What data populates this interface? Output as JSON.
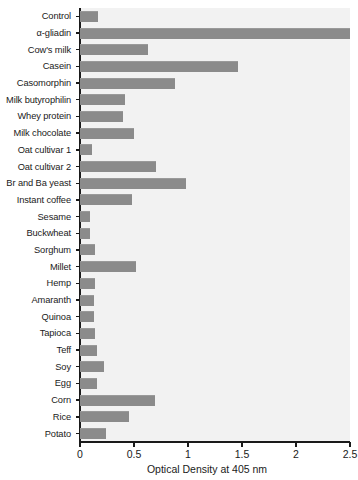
{
  "chart_data": {
    "type": "bar",
    "orientation": "horizontal",
    "title": "",
    "xlabel": "Optical Density at 405 nm",
    "ylabel": "",
    "xlim": [
      0,
      2.5
    ],
    "xticks": [
      0,
      0.5,
      1,
      1.5,
      2,
      2.5
    ],
    "xtick_labels": [
      "0",
      "0.5",
      "1",
      "1.5",
      "2",
      "2.5"
    ],
    "grid": false,
    "legend": null,
    "bar_color": "#8b8b8b",
    "plot_background": "#f2f2f2",
    "categories": [
      "Control",
      "α-gliadin",
      "Cow's milk",
      "Casein",
      "Casomorphin",
      "Milk butyrophilin",
      "Whey protein",
      "Milk chocolate",
      "Oat cultivar 1",
      "Oat cultivar 2",
      "Br and Ba yeast",
      "Instant coffee",
      "Sesame",
      "Buckwheat",
      "Sorghum",
      "Millet",
      "Hemp",
      "Amaranth",
      "Quinoa",
      "Tapioca",
      "Teff",
      "Soy",
      "Egg",
      "Corn",
      "Rice",
      "Potato"
    ],
    "values": [
      0.17,
      2.52,
      0.63,
      1.46,
      0.88,
      0.42,
      0.4,
      0.5,
      0.11,
      0.7,
      0.98,
      0.48,
      0.09,
      0.09,
      0.14,
      0.52,
      0.14,
      0.13,
      0.13,
      0.14,
      0.16,
      0.22,
      0.16,
      0.69,
      0.45,
      0.24
    ]
  }
}
